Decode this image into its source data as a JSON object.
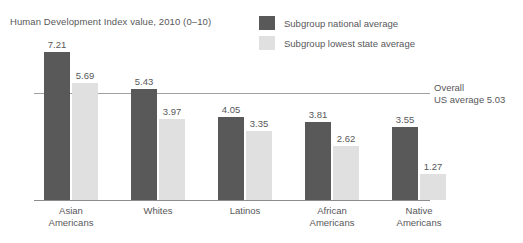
{
  "chart_data": {
    "type": "bar",
    "title": "Human Development Index value, 2010 (0–10)",
    "xlabel": "",
    "ylabel": "",
    "ylim": [
      0,
      10
    ],
    "grid": false,
    "legend_position": "top-right",
    "categories": [
      "Asian\nAmericans",
      "Whites",
      "Latinos",
      "African\nAmericans",
      "Native\nAmericans"
    ],
    "series": [
      {
        "name": "Subgroup national average",
        "color": "#595959",
        "values": [
          7.21,
          5.43,
          4.05,
          3.81,
          3.55
        ]
      },
      {
        "name": "Subgroup lowest state average",
        "color": "#e0e0e0",
        "values": [
          5.69,
          3.97,
          3.35,
          2.62,
          1.27
        ]
      }
    ],
    "annotations": [
      {
        "name": "overall-us-average",
        "value": 5.03,
        "line1": "Overall",
        "line2": "US average 5.03"
      }
    ]
  },
  "chart": {
    "title": "Human Development Index value, 2010 (0–10)",
    "legend": [
      {
        "label": "Subgroup national average",
        "color": "#595959"
      },
      {
        "label": "Subgroup lowest state average",
        "color": "#e0e0e0"
      }
    ],
    "groups": [
      {
        "label_line1": "Asian",
        "label_line2": "Americans",
        "national": "7.21",
        "lowest": "5.69"
      },
      {
        "label_line1": "Whites",
        "label_line2": "",
        "national": "5.43",
        "lowest": "3.97"
      },
      {
        "label_line1": "Latinos",
        "label_line2": "",
        "national": "4.05",
        "lowest": "3.35"
      },
      {
        "label_line1": "African",
        "label_line2": "Americans",
        "national": "3.81",
        "lowest": "2.62"
      },
      {
        "label_line1": "Native",
        "label_line2": "Americans",
        "national": "3.55",
        "lowest": "1.27"
      }
    ],
    "reference": {
      "line1": "Overall",
      "line2": "US average 5.03"
    }
  }
}
